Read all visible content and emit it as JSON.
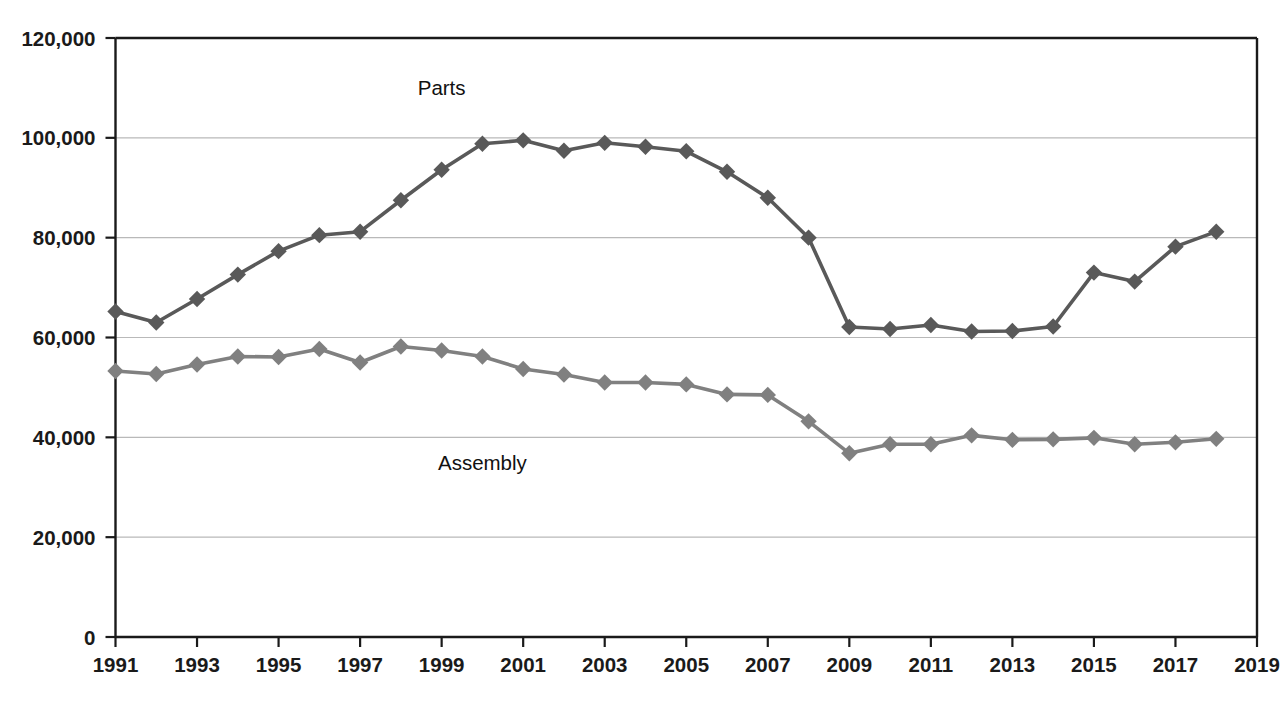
{
  "chart_data": {
    "type": "line",
    "title": "",
    "subtitle": "",
    "xlabel": "",
    "ylabel": "",
    "grid": true,
    "grid_axis": "y",
    "legend_position": "inline-annotation",
    "xlim": [
      1991,
      2019
    ],
    "ylim": [
      0,
      120000
    ],
    "x": [
      1991,
      1992,
      1993,
      1994,
      1995,
      1996,
      1997,
      1998,
      1999,
      2000,
      2001,
      2002,
      2003,
      2004,
      2005,
      2006,
      2007,
      2008,
      2009,
      2010,
      2011,
      2012,
      2013,
      2014,
      2015,
      2016,
      2017,
      2018
    ],
    "x_tick_labels": [
      "1991",
      "1993",
      "1995",
      "1997",
      "1999",
      "2001",
      "2003",
      "2005",
      "2007",
      "2009",
      "2011",
      "2013",
      "2015",
      "2017",
      "2019"
    ],
    "x_tick_values": [
      1991,
      1993,
      1995,
      1997,
      1999,
      2001,
      2003,
      2005,
      2007,
      2009,
      2011,
      2013,
      2015,
      2017,
      2019
    ],
    "y_tick_labels": [
      "0",
      "20,000",
      "40,000",
      "60,000",
      "80,000",
      "100,000",
      "120,000"
    ],
    "y_tick_values": [
      0,
      20000,
      40000,
      60000,
      80000,
      100000,
      120000
    ],
    "series": [
      {
        "name": "Parts",
        "color": "#595959",
        "marker": "diamond",
        "label_x": 1999,
        "label_y": 108500,
        "values": [
          65200,
          63000,
          67700,
          72600,
          77300,
          80500,
          81200,
          87500,
          93600,
          98800,
          99500,
          97400,
          99000,
          98200,
          97300,
          93200,
          88000,
          80000,
          62100,
          61700,
          62500,
          61200,
          61300,
          62200,
          73000,
          71200,
          78200,
          81200
        ]
      },
      {
        "name": "Assembly",
        "color": "#808080",
        "marker": "diamond",
        "label_x": 2000,
        "label_y": 33500,
        "values": [
          53300,
          52700,
          54600,
          56200,
          56100,
          57700,
          55000,
          58200,
          57400,
          56200,
          53700,
          52600,
          51000,
          51000,
          50600,
          48600,
          48500,
          43200,
          36800,
          38600,
          38600,
          40400,
          39500,
          39600,
          39900,
          38600,
          39000,
          39700
        ]
      }
    ]
  },
  "axis": {
    "y_axis_name": "value-axis",
    "x_axis_name": "year-axis"
  }
}
